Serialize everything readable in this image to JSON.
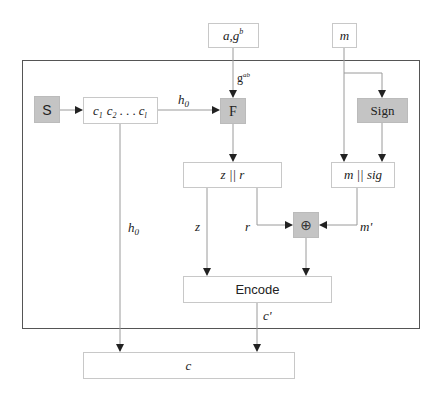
{
  "diagram": {
    "colors": {
      "box_fill": "#ffffff",
      "box_stroke": "#c8c8c8",
      "gray_fill": "#c4c4c4",
      "outer_stroke": "#555555",
      "line": "#9a9a9a",
      "arrow": "#222222",
      "text": "#222222"
    },
    "inputs": {
      "key_box": {
        "base": "a,g",
        "sup": "b"
      },
      "message_box": "m"
    },
    "nodes": {
      "s_box": "S",
      "ciphertext_chain": {
        "c1": "c",
        "c1_sub": "1",
        "c2": "c",
        "c2_sub": "2",
        "dots": ". . .",
        "cl": "c",
        "cl_sub": "l"
      },
      "f_box": "F",
      "sign_box": "Sign",
      "z_r_box": "z || r",
      "m_sig_box": "m || sig",
      "xor_box": "⊕",
      "encode_box": "Encode",
      "output_box": "c"
    },
    "edge_labels": {
      "h0_top": {
        "base": "h",
        "sub": "0"
      },
      "gab": {
        "base": "g",
        "sup": "ab"
      },
      "h0_left": {
        "base": "h",
        "sub": "0"
      },
      "z": "z",
      "r": "r",
      "m_prime": "m'",
      "c_prime": "c'"
    }
  }
}
